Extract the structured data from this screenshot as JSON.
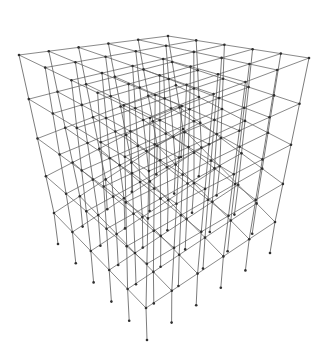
{
  "figure": {
    "title": "3D structural frame wireframe",
    "background_color": "#ffffff",
    "line_color": "#5a5a5a",
    "node_color": "#2e2e2e"
  },
  "grid": {
    "bays_x": 5,
    "bays_y": 5,
    "floor_levels": 5,
    "has_base_stubs": true
  },
  "projection": {
    "top_corner_left": [
      19,
      55
    ],
    "top_corner_back": [
      168,
      36
    ],
    "top_corner_right": [
      309,
      58
    ],
    "top_corner_front": [
      150,
      118
    ],
    "lowest_floor_corner_left": [
      54,
      213
    ],
    "lowest_floor_corner_right": [
      275,
      222
    ],
    "lowest_floor_corner_front": [
      146,
      308
    ],
    "base_tip_front": [
      147,
      340
    ],
    "base_tip_left": [
      58,
      244
    ],
    "base_tip_right": [
      270,
      253
    ]
  }
}
